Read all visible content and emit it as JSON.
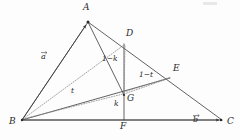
{
  "figure": {
    "type": "geometry-diagram",
    "width": 240,
    "height": 140,
    "colors": {
      "solid_line": "#3a3a3a",
      "dotted_line": "#7a7a7a",
      "label_text": "#2b2b2b",
      "background": "#fdfdfd"
    },
    "points": [
      {
        "id": "A",
        "label": "A",
        "x": 88,
        "y": 22,
        "label_x": 83,
        "label_y": 4
      },
      {
        "id": "B",
        "label": "B",
        "x": 22,
        "y": 120,
        "label_x": 10,
        "label_y": 118
      },
      {
        "id": "C",
        "label": "C",
        "x": 222,
        "y": 120,
        "label_x": 227,
        "label_y": 118
      },
      {
        "id": "D",
        "label": "D",
        "x": 124,
        "y": 44,
        "label_x": 126,
        "label_y": 30
      },
      {
        "id": "E",
        "label": "E",
        "x": 170,
        "y": 78,
        "label_x": 173,
        "label_y": 65
      },
      {
        "id": "F",
        "label": "F",
        "x": 124,
        "y": 120,
        "label_x": 120,
        "label_y": 122
      },
      {
        "id": "G",
        "label": "G",
        "x": 124,
        "y": 95,
        "label_x": 127,
        "label_y": 95
      }
    ],
    "segments": [
      {
        "id": "AB",
        "from": "A",
        "to": "B",
        "style": "solid"
      },
      {
        "id": "AC",
        "from": "A",
        "to": "C",
        "style": "solid"
      },
      {
        "id": "BC",
        "from": "B",
        "to": "C",
        "style": "solid"
      },
      {
        "id": "AG",
        "from": "A",
        "to": "G",
        "style": "solid"
      },
      {
        "id": "DF",
        "from": "D",
        "to": "F",
        "style": "solid"
      },
      {
        "id": "BE",
        "from": "B",
        "to": "E",
        "style": "solid"
      },
      {
        "id": "BD",
        "from": "B",
        "to": "D",
        "style": "dotted"
      },
      {
        "id": "BG",
        "from": "B",
        "to": "G",
        "style": "dotted"
      },
      {
        "id": "GE",
        "from": "G",
        "to": "E",
        "style": "dotted"
      },
      {
        "id": "DG",
        "from": "D",
        "to": "G",
        "style": "dotted"
      }
    ],
    "arrow_segments": [
      {
        "id": "BA-vector",
        "from": "B",
        "to": "A",
        "label": "a"
      },
      {
        "id": "BC-vector",
        "from": "B",
        "to": "C",
        "label": "b"
      }
    ],
    "vector_labels": [
      {
        "id": "vec-a",
        "text": "a",
        "x": 41,
        "y": 54
      },
      {
        "id": "vec-b",
        "text": "b",
        "x": 193,
        "y": 117
      }
    ],
    "parameter_labels": [
      {
        "id": "param-t",
        "text": "t",
        "x": 71,
        "y": 88
      },
      {
        "id": "param-1-minus-t",
        "text": "1−t",
        "x": 140,
        "y": 72
      },
      {
        "id": "param-1-minus-k",
        "text": "1−k",
        "x": 103,
        "y": 56
      },
      {
        "id": "param-k",
        "text": "k",
        "x": 114,
        "y": 101
      }
    ]
  }
}
